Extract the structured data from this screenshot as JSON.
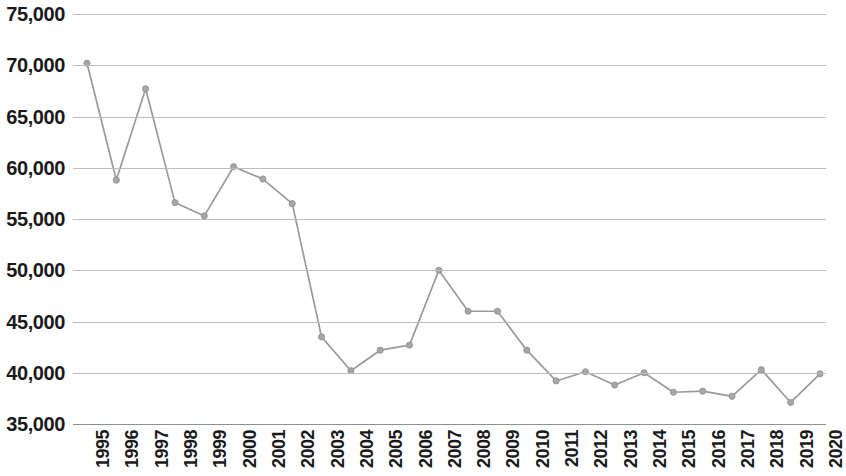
{
  "chart_data": {
    "type": "line",
    "title": "",
    "subtitle": "",
    "xlabel": "",
    "ylabel": "",
    "grid": true,
    "legend": false,
    "legend_position": "none",
    "ylim": [
      35000,
      75000
    ],
    "y_tick_interval": 5000,
    "y_ticks": [
      75000,
      70000,
      65000,
      60000,
      55000,
      50000,
      45000,
      40000,
      35000
    ],
    "y_tick_labels": [
      "75,000",
      "70,000",
      "65,000",
      "60,000",
      "55,000",
      "50,000",
      "45,000",
      "40,000",
      "35,000"
    ],
    "categories": [
      "1995",
      "1996",
      "1997",
      "1998",
      "1999",
      "2000",
      "2001",
      "2002",
      "2003",
      "2004",
      "2005",
      "2006",
      "2007",
      "2008",
      "2009",
      "2010",
      "2011",
      "2012",
      "2013",
      "2014",
      "2015",
      "2016",
      "2017",
      "2018",
      "2019",
      "2020"
    ],
    "x_tick_labels": [
      "1995",
      "1996",
      "1997",
      "1998",
      "1999",
      "2000",
      "2001",
      "2002",
      "2003",
      "2004",
      "2005",
      "2006",
      "2007",
      "2008",
      "2009",
      "2010",
      "2011",
      "2012",
      "2013",
      "2014",
      "2015",
      "2016",
      "2017",
      "2018",
      "2019",
      "2020"
    ],
    "x_tick_rotation": -90,
    "values": [
      70200,
      58800,
      67700,
      56600,
      55300,
      60100,
      58900,
      56500,
      43500,
      40200,
      42200,
      42700,
      50000,
      46000,
      46000,
      42200,
      39200,
      40100,
      38800,
      40000,
      38100,
      38200,
      37700,
      40300,
      37100,
      39900
    ],
    "series": [
      {
        "name": "",
        "values": [
          70200,
          58800,
          67700,
          56600,
          55300,
          60100,
          58900,
          56500,
          43500,
          40200,
          42200,
          42700,
          50000,
          46000,
          46000,
          42200,
          39200,
          40100,
          38800,
          40000,
          38100,
          38200,
          37700,
          40300,
          37100,
          39900
        ],
        "line_color": "#9a9a9a",
        "marker_color": "#a6a6a6",
        "marker": "circle"
      }
    ],
    "colors": {
      "line": "#9a9a9a",
      "marker": "#a6a6a6",
      "gridline": "#b9bcc2",
      "axis_line": "#8c8f95",
      "tick_label": "#1a1a1a",
      "background": "#ffffff"
    }
  }
}
